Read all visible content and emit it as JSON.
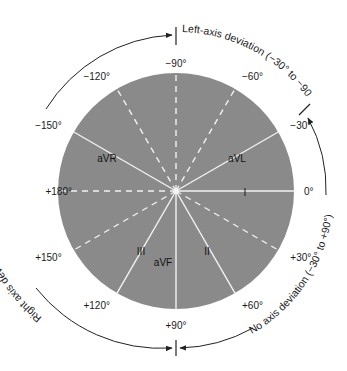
{
  "diagram": {
    "colors": {
      "circle_fill": "#8a8a8a",
      "axis_line": "#f2f2f2",
      "text": "#1a1a1a",
      "arc": "#222222",
      "background": "#ffffff"
    },
    "geometry": {
      "cx": 176,
      "cy": 191,
      "r": 118
    },
    "degree_labels": [
      {
        "angle": 0,
        "text": "0°"
      },
      {
        "angle": -30,
        "text": "−30°"
      },
      {
        "angle": -60,
        "text": "−60°"
      },
      {
        "angle": -90,
        "text": "−90°"
      },
      {
        "angle": -120,
        "text": "−120°"
      },
      {
        "angle": -150,
        "text": "−150°"
      },
      {
        "angle": 180,
        "text": "+180°"
      },
      {
        "angle": 150,
        "text": "+150°"
      },
      {
        "angle": 120,
        "text": "+120°"
      },
      {
        "angle": 90,
        "text": "+90°"
      },
      {
        "angle": 60,
        "text": "+60°"
      },
      {
        "angle": 30,
        "text": "+30°"
      }
    ],
    "leads": [
      {
        "name": "I",
        "angle": 0,
        "text": "I"
      },
      {
        "name": "II",
        "angle": 60,
        "text": "II"
      },
      {
        "name": "III",
        "angle": 120,
        "text": "III"
      },
      {
        "name": "aVR",
        "angle": -150,
        "text": "aVR"
      },
      {
        "name": "aVL",
        "angle": -30,
        "text": "aVL"
      },
      {
        "name": "aVF",
        "angle": 90,
        "text": "aVF"
      }
    ],
    "dashed_axes": [
      -90,
      -60,
      -120,
      180,
      150,
      30
    ],
    "deviation_ranges": [
      {
        "name": "left-axis-deviation",
        "text": "Left-axis deviation (−30° to −90°)"
      },
      {
        "name": "right-axis-deviation",
        "text": "Right axis deviation (+90° to −90°)"
      },
      {
        "name": "no-axis-deviation",
        "text": "No axis deviation (−30° to +90°)"
      }
    ]
  }
}
